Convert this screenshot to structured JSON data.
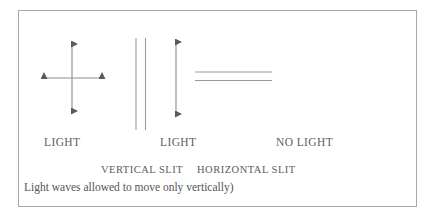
{
  "figure": {
    "background_color": "#ffffff",
    "frame_color": "#a8a8a8",
    "ink_color": "#5d5d5d"
  },
  "labels": {
    "light_left": "LIGHT",
    "light_middle": "LIGHT",
    "no_light": "NO LIGHT",
    "vertical_slit": "VERTICAL SLIT",
    "horizontal_slit": "HORIZONTAL SLIT",
    "caption": "Light waves allowed to move only vertically)"
  },
  "diagram": {
    "unpolarized_wave": {
      "name": "cross-double-arrow",
      "vertical_arrow": {
        "x": 72,
        "y1": 42,
        "y2": 113
      },
      "horizontal_arrow": {
        "y": 78,
        "x1": 42,
        "x2": 104
      }
    },
    "vertical_slit": {
      "name": "vertical-slit-pair",
      "line1_x": 136,
      "line2_x": 145,
      "y1": 38,
      "y2": 130
    },
    "polarized_wave": {
      "name": "vertical-double-arrow",
      "x": 176,
      "y1": 40,
      "y2": 116
    },
    "horizontal_slit": {
      "name": "horizontal-slit-pair",
      "line1_y": 72,
      "line2_y": 80,
      "x1": 195,
      "x2": 272
    }
  }
}
